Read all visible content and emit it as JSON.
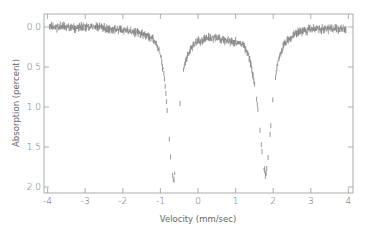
{
  "chart_data": {
    "type": "line",
    "title": "",
    "xlabel": "Velocity (mm/sec)",
    "ylabel": "Absorption (percent)",
    "xlim": [
      -4,
      4
    ],
    "ylim": [
      0.0,
      2.0
    ],
    "y_inverted": true,
    "grid": false,
    "legend": null,
    "x_ticks": [
      -4,
      -3,
      -2,
      -1,
      0,
      1,
      2,
      3,
      4
    ],
    "x_tick_labels": [
      "-4",
      "-3",
      "-2",
      "-1",
      "0",
      "1",
      "2",
      "3",
      "4"
    ],
    "y_ticks": [
      0.0,
      0.5,
      1.0,
      1.5,
      2.0
    ],
    "y_tick_labels": [
      "0.0",
      "0.5",
      "1.0",
      "1.5",
      "2.0"
    ],
    "series": [
      {
        "name": "Mössbauer spectrum",
        "style": "noisy data points",
        "color": "#6b6b6b",
        "peaks": [
          {
            "velocity": -0.65,
            "absorption": 1.93
          },
          {
            "velocity": 1.8,
            "absorption": 1.86
          }
        ],
        "x": [
          -4.0,
          -3.6,
          -3.2,
          -2.8,
          -2.4,
          -2.0,
          -1.6,
          -1.4,
          -1.2,
          -1.1,
          -1.0,
          -0.9,
          -0.85,
          -0.8,
          -0.75,
          -0.7,
          -0.65,
          -0.6,
          -0.55,
          -0.5,
          -0.45,
          -0.4,
          -0.3,
          -0.2,
          -0.1,
          0.0,
          0.2,
          0.4,
          0.6,
          0.8,
          1.0,
          1.2,
          1.3,
          1.4,
          1.5,
          1.6,
          1.65,
          1.7,
          1.75,
          1.8,
          1.85,
          1.9,
          1.95,
          2.0,
          2.1,
          2.2,
          2.3,
          2.4,
          2.6,
          2.8,
          3.0,
          3.4,
          3.8,
          4.0
        ],
        "y": [
          0.0,
          0.0,
          0.01,
          0.0,
          0.02,
          0.04,
          0.07,
          0.1,
          0.15,
          0.22,
          0.35,
          0.6,
          0.85,
          1.15,
          1.5,
          1.78,
          1.93,
          1.8,
          1.5,
          1.1,
          0.8,
          0.58,
          0.38,
          0.28,
          0.22,
          0.18,
          0.15,
          0.14,
          0.15,
          0.17,
          0.19,
          0.23,
          0.3,
          0.45,
          0.7,
          1.05,
          1.3,
          1.55,
          1.75,
          1.86,
          1.7,
          1.45,
          1.15,
          0.85,
          0.5,
          0.33,
          0.22,
          0.15,
          0.08,
          0.05,
          0.03,
          0.02,
          0.02,
          0.01
        ]
      }
    ]
  },
  "plot_area_px": {
    "left": 44,
    "right": 353,
    "top": 14,
    "bottom": 193
  },
  "axis_map_px": {
    "x0": 198,
    "x_per_unit": 37.6,
    "y0": 27,
    "y_per_unit": 80
  }
}
